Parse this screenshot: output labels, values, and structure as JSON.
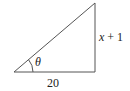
{
  "diagram": {
    "type": "right-triangle",
    "vertices": {
      "bottom_left": [
        14,
        72
      ],
      "bottom_right": [
        95,
        72
      ],
      "top": [
        95,
        3
      ]
    },
    "labels": {
      "angle": "θ",
      "vertical_side": "x + 1",
      "horizontal_side": "20"
    },
    "colors": {
      "stroke": "#555555",
      "text": "#222222",
      "background": "#ffffff"
    }
  }
}
